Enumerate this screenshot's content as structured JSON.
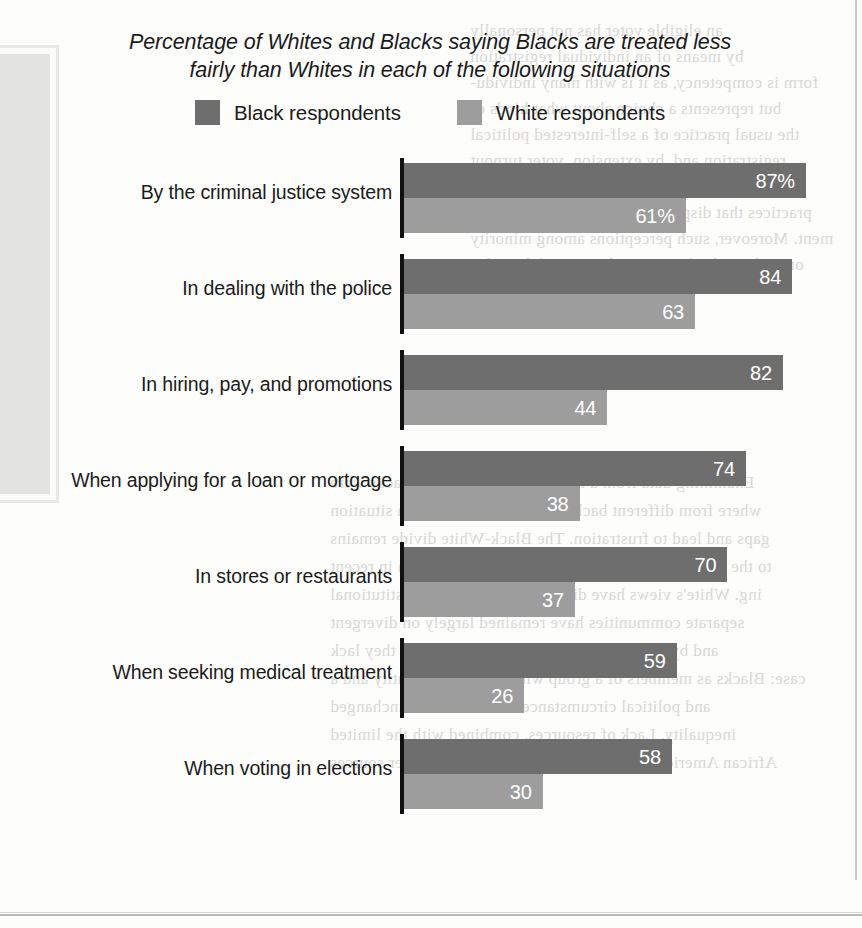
{
  "title": {
    "line1": "Percentage of Whites and Blacks saying Blacks are treated less",
    "line2": "fairly than Whites in each of the following situations"
  },
  "legend": [
    {
      "label": "Black respondents",
      "color": "#6e6e6e",
      "icon": "legend-swatch"
    },
    {
      "label": "White respondents",
      "color": "#9d9d9d",
      "icon": "legend-swatch"
    }
  ],
  "chart_data": {
    "type": "bar",
    "orientation": "horizontal",
    "title": "Percentage of Whites and Blacks saying Blacks are treated less fairly than Whites in each of the following situations",
    "xlabel": "",
    "ylabel": "",
    "xlim": [
      0,
      100
    ],
    "grid": false,
    "legend_position": "top-center",
    "axis_visible": true,
    "categories": [
      "By the criminal justice system",
      "In dealing with the police",
      "In hiring, pay, and promotions",
      "When applying for a loan or mortgage",
      "In stores or restaurants",
      "When seeking medical treatment",
      "When voting in elections"
    ],
    "series": [
      {
        "name": "Black respondents",
        "color": "#6e6e6e",
        "values": [
          87,
          84,
          82,
          74,
          70,
          59,
          58
        ],
        "labels": [
          "87%",
          "84",
          "82",
          "74",
          "70",
          "59",
          "58"
        ]
      },
      {
        "name": "White respondents",
        "color": "#9d9d9d",
        "values": [
          61,
          63,
          44,
          38,
          37,
          26,
          30
        ],
        "labels": [
          "61%",
          "63",
          "44",
          "38",
          "37",
          "26",
          "30"
        ]
      }
    ]
  },
  "artifacts": {
    "bleed_lines": [
      "an eligible voter has not personally",
      "by means of an individual registration",
      "form is competency, as it is with many individu-",
      "but represents a choice about what kinds of",
      "the usual practice of a self-interested political",
      "registration and, by extension, voter turnout",
      "turn, the country's existing registration and ele",
      "practices that disproportionately affect the poor",
      "ment. Moreover, such perceptions among minority",
      "ones about the fairness and equity of the politi",
      "Examining data from a recent national survey, Blacks were",
      "where from different backgrounds in the American situation",
      "gaps and lead to frustration. The Black-White divide remains",
      "to the United States. Things have not changed much in recent",
      "ing. White's views have diverse complaints and institutional",
      "separate communities have remained largely on divergent",
      "and by private industry's the impression that they lack",
      "case: Blacks as members of a group with a common identity and a",
      "and political circumstances often remains unchanged",
      "inequality. Lack of resources, combined with the limited",
      "African Americans are more likely to report that other sources"
    ]
  }
}
